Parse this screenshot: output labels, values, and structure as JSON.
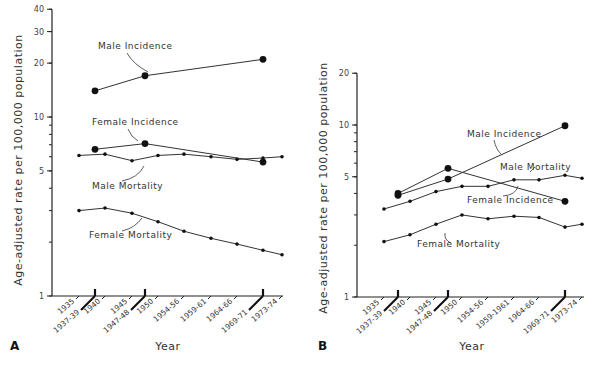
{
  "chart_data": [
    {
      "type": "line",
      "panel": "A",
      "xlabel": "Year",
      "ylabel": "Age-adjusted rate per 100,000 population",
      "yscale": "log",
      "ylim": [
        1,
        40
      ],
      "yticks": [
        1,
        5,
        10,
        20,
        30,
        40
      ],
      "ytick_labels": [
        "1",
        "5",
        "10",
        "20",
        "30",
        "40"
      ],
      "categories": [
        "1935",
        "1937-39",
        "1940",
        "1945",
        "1947-48",
        "1950",
        "1954-56",
        "1959-61",
        "1964-66",
        "1969-71",
        "1973-74"
      ],
      "major_period_categories": [
        "1937-39",
        "1947-48",
        "1969-71"
      ],
      "series": [
        {
          "name": "Male Incidence",
          "marker": "large",
          "x": [
            "1937-39",
            "1947-48",
            "1969-71"
          ],
          "values": [
            14,
            17,
            21
          ]
        },
        {
          "name": "Female Incidence",
          "marker": "large",
          "x": [
            "1937-39",
            "1947-48",
            "1969-71"
          ],
          "values": [
            6.6,
            7.1,
            5.6
          ]
        },
        {
          "name": "Male Mortality",
          "marker": "small",
          "x": [
            "1935",
            "1940",
            "1945",
            "1950",
            "1954-56",
            "1959-61",
            "1964-66",
            "1969-71",
            "1973-74"
          ],
          "values": [
            6.1,
            6.2,
            5.7,
            6.1,
            6.2,
            6.0,
            5.8,
            5.9,
            6.0
          ]
        },
        {
          "name": "Female Mortality",
          "marker": "small",
          "x": [
            "1935",
            "1940",
            "1945",
            "1950",
            "1954-56",
            "1959-61",
            "1964-66",
            "1969-71",
            "1973-74"
          ],
          "values": [
            3.0,
            3.1,
            2.9,
            2.6,
            2.3,
            2.1,
            1.95,
            1.8,
            1.7
          ]
        }
      ]
    },
    {
      "type": "line",
      "panel": "B",
      "xlabel": "Year",
      "ylabel": "Age-adjusted rate per 100,000 population",
      "yscale": "log",
      "ylim": [
        1,
        20
      ],
      "yticks": [
        1,
        5,
        10,
        20
      ],
      "ytick_labels": [
        "1",
        "5",
        "10",
        "20"
      ],
      "categories": [
        "1935",
        "1937-39",
        "1940",
        "1945",
        "1947-48",
        "1950",
        "1954-56",
        "1959-1961",
        "1964-66",
        "1969-71",
        "1973-74"
      ],
      "major_period_categories": [
        "1937-39",
        "1947-48",
        "1969-71"
      ],
      "series": [
        {
          "name": "Male Incidence",
          "marker": "large",
          "x": [
            "1937-39",
            "1947-48",
            "1969-71"
          ],
          "values": [
            3.9,
            4.85,
            9.9
          ]
        },
        {
          "name": "Female Incidence",
          "marker": "large",
          "x": [
            "1937-39",
            "1947-48",
            "1969-71"
          ],
          "values": [
            4.0,
            5.6,
            3.6
          ]
        },
        {
          "name": "Male Mortality",
          "marker": "small",
          "x": [
            "1935",
            "1940",
            "1945",
            "1950",
            "1954-56",
            "1959-1961",
            "1964-66",
            "1969-71",
            "1973-74"
          ],
          "values": [
            3.25,
            3.6,
            4.1,
            4.4,
            4.4,
            4.8,
            4.8,
            5.1,
            4.9
          ]
        },
        {
          "name": "Female Mortality",
          "marker": "small",
          "x": [
            "1935",
            "1940",
            "1945",
            "1950",
            "1954-56",
            "1959-1961",
            "1964-66",
            "1969-71",
            "1973-74"
          ],
          "values": [
            2.1,
            2.3,
            2.65,
            3.0,
            2.85,
            2.95,
            2.9,
            2.55,
            2.65
          ]
        }
      ]
    }
  ]
}
